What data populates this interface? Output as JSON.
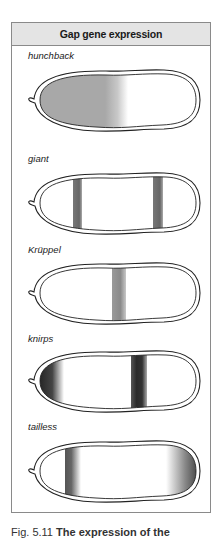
{
  "panel": {
    "title": "Gap gene expression"
  },
  "genes": [
    {
      "name": "hunchback",
      "pattern": "anterior-half gradient"
    },
    {
      "name": "giant",
      "pattern": "two bands (anterior and posterior)"
    },
    {
      "name": "Krüppel",
      "pattern": "central band"
    },
    {
      "name": "knirps",
      "pattern": "anterior tip and posterior band"
    },
    {
      "name": "tailless",
      "pattern": "anterior band and posterior tip"
    }
  ],
  "caption": {
    "label": "Fig. 5.11",
    "text": "The expression of the"
  },
  "colors": {
    "panel_border": "#8a8a8a",
    "header_fill": "#e4e4e4",
    "stain": "#5a5a5a",
    "stain_light": "#9a9a9a"
  }
}
